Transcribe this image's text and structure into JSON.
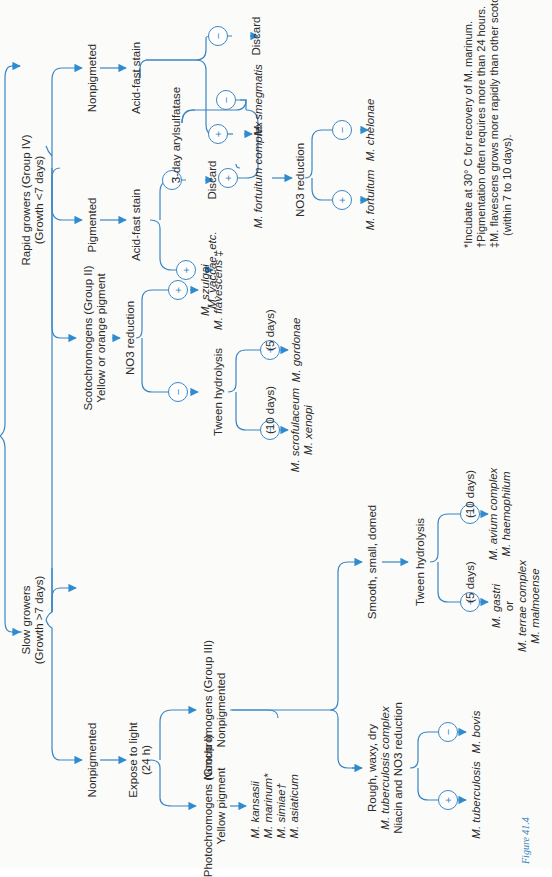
{
  "figure": {
    "caption": "Figure 41.4",
    "accent_color": "#3a86c4",
    "text_color": "#2b2b2b"
  },
  "root": {
    "rapid": {
      "title": "Rapid growers (Group IV)",
      "sub": "(Growth <7 days)"
    },
    "slow": {
      "title": "Slow growers",
      "sub": "(Growth >7 days)"
    }
  },
  "rapid_branch": {
    "pigmented": "Pigmented",
    "nonpigmented": "Nonpigmeted",
    "acid_fast_left": "Acid-fast stain",
    "acid_fast_right": "Acid-fast stain",
    "discard_left": "Discard",
    "discard_right": "Discard",
    "vaccae": "M. vaccae, etc.",
    "arylsulfatase": "3-day arylsulfatase",
    "smegmatis": "M. smegmatis",
    "fortuitum_complex": "M. fortuitum complex",
    "no3": "NO3 reduction",
    "fortuitum": "M. fortuitum",
    "chelonae": "M. chelonae"
  },
  "slow_branch": {
    "nonpigmented": "Nonpigmented",
    "expose": "Expose to light",
    "expose_sub": "(24 h)",
    "photo_title": "Photochromogens (Group I)",
    "photo_sub": "Yellow pigment",
    "photo_species": [
      "M. kansasii",
      "M. marinum*",
      "M. simiae†",
      "M. asiaticum"
    ],
    "nonchromo_title": "Nonchromogens (Group III)",
    "nonchromo_sub": "Nonpigmented",
    "scoto_title": "Scotochromogens (Group II)",
    "scoto_sub": "Yellow or orange pigment",
    "scoto_no3": "NO3 reduction",
    "szulgai": "M. szulgai",
    "flavescens": "M. flavescens ‡",
    "tween1": "Tween hydrolysis",
    "tween1_neg_days": "(10 days)",
    "tween1_pos_days": "(5 days)",
    "scrofulaceum": "M. scrofulaceum",
    "xenopi": "M. xenopi",
    "gordonae": "M. gordonae",
    "rough": [
      "Rough, waxy, dry",
      "M. tuberculosis complex",
      "Niacin and NO3 reduction"
    ],
    "tuberculosis": "M. tuberculosis",
    "bovis": "M. bovis",
    "smooth": "Smooth, small, domed",
    "tween2": "Tween hydrolysis",
    "tween2_pos_days": "(5 days)",
    "tween2_neg_days": "(10 days)",
    "gastri": [
      "M. gastri",
      "or",
      "M. terrae complex",
      "M. malmoense"
    ],
    "avium": [
      "M. avium complex",
      "M. haemophilum"
    ]
  },
  "symbols": {
    "plus": "+",
    "minus": "−"
  },
  "footnotes": [
    "*Incubate at 30° C for recovery of M. marinum.",
    "†Pigmentation often requires more than 24 hours.",
    "‡M. flavescens grows more rapidly than other scotochromogens",
    "(within 7 to 10 days)."
  ]
}
